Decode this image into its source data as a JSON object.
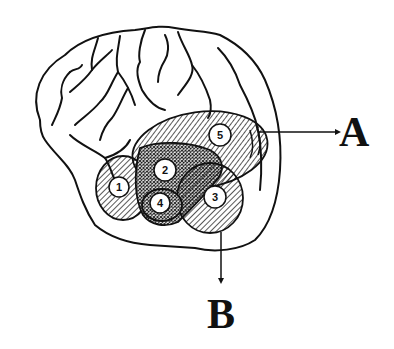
{
  "diagram": {
    "type": "brain-lateral-view",
    "colors": {
      "stroke": "#111111",
      "background": "#ffffff"
    },
    "regions": [
      {
        "id": "1",
        "label": "1",
        "pattern": "diagonal-hatch"
      },
      {
        "id": "2",
        "label": "2",
        "pattern": "crosshatch-dots"
      },
      {
        "id": "3",
        "label": "3",
        "pattern": "diagonal-hatch"
      },
      {
        "id": "4",
        "label": "4",
        "pattern": "crosshatch-dots"
      },
      {
        "id": "5",
        "label": "5",
        "pattern": "diagonal-hatch"
      }
    ],
    "callouts": [
      {
        "id": "A",
        "label": "A",
        "from_region": "5",
        "direction": "right"
      },
      {
        "id": "B",
        "label": "B",
        "from_region": "3",
        "direction": "down"
      }
    ]
  }
}
